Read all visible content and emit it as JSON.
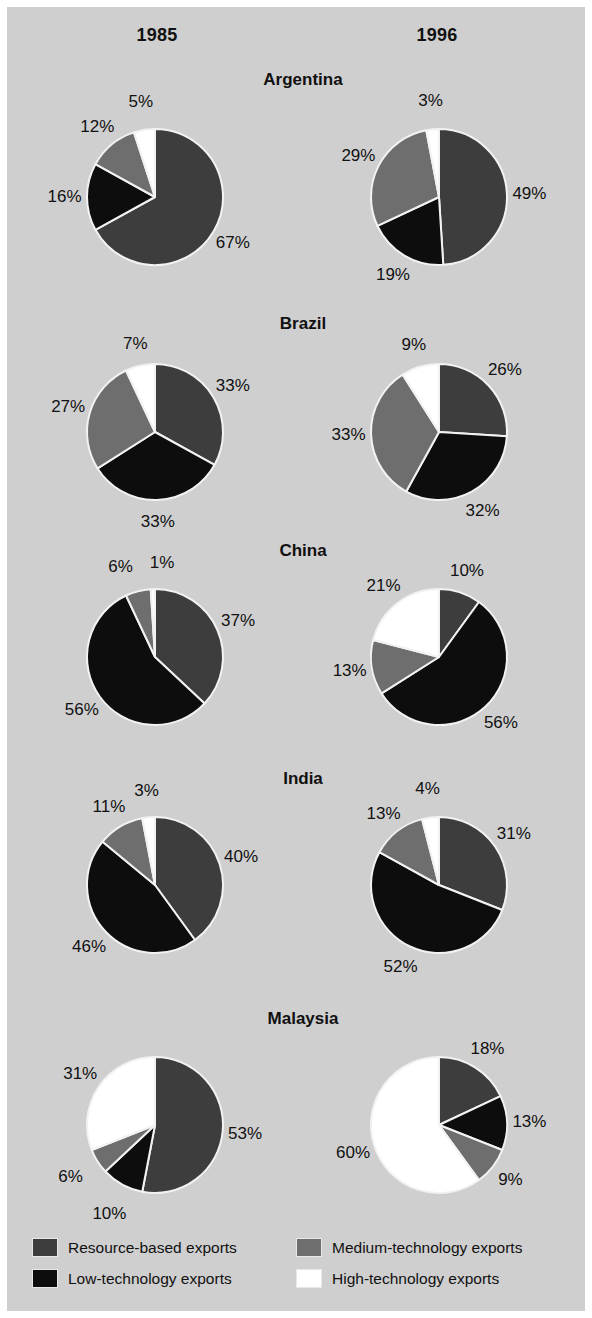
{
  "figure": {
    "background_color": "#cfcfcf",
    "border_color": "#ffffff",
    "text_color": "#111111"
  },
  "columns": [
    {
      "label": "1985",
      "key": "y1985"
    },
    {
      "label": "1996",
      "key": "y1996"
    }
  ],
  "legend": {
    "items": [
      {
        "label": "Resource-based exports",
        "color": "#3d3d3d",
        "key": "resource"
      },
      {
        "label": "Low-technology exports",
        "color": "#0d0d0d",
        "key": "low"
      },
      {
        "label": "Medium-technology exports",
        "color": "#6e6e6e",
        "key": "medium"
      },
      {
        "label": "High-technology exports",
        "color": "#ffffff",
        "key": "high"
      }
    ]
  },
  "chart_data": {
    "type": "pie",
    "title": "",
    "subtitle": "",
    "xlabel": "",
    "ylabel": "",
    "legend_position": "bottom",
    "grid": false,
    "units": "percent",
    "slice_order": [
      "resource",
      "low",
      "medium",
      "high"
    ],
    "category_labels": [
      "Resource-based exports",
      "Low-technology exports",
      "Medium-technology exports",
      "High-technology exports"
    ],
    "category_colors": [
      "#3d3d3d",
      "#0d0d0d",
      "#6e6e6e",
      "#ffffff"
    ],
    "years": [
      "1985",
      "1996"
    ],
    "countries": [
      {
        "name": "Argentina",
        "pies": [
          {
            "year": "1985",
            "values": [
              67,
              16,
              12,
              5
            ],
            "labels": [
              "67%",
              "16%",
              "12%",
              "5%"
            ]
          },
          {
            "year": "1996",
            "values": [
              49,
              19,
              29,
              3
            ],
            "labels": [
              "49%",
              "19%",
              "29%",
              "3%"
            ]
          }
        ]
      },
      {
        "name": "Brazil",
        "pies": [
          {
            "year": "1985",
            "values": [
              33,
              33,
              27,
              7
            ],
            "labels": [
              "33%",
              "33%",
              "27%",
              "7%"
            ]
          },
          {
            "year": "1996",
            "values": [
              26,
              32,
              33,
              9
            ],
            "labels": [
              "26%",
              "32%",
              "33%",
              "9%"
            ]
          }
        ]
      },
      {
        "name": "China",
        "pies": [
          {
            "year": "1985",
            "values": [
              37,
              56,
              6,
              1
            ],
            "labels": [
              "37%",
              "56%",
              "6%",
              "1%"
            ]
          },
          {
            "year": "1996",
            "values": [
              10,
              56,
              13,
              21
            ],
            "labels": [
              "10%",
              "56%",
              "13%",
              "21%"
            ]
          }
        ]
      },
      {
        "name": "India",
        "pies": [
          {
            "year": "1985",
            "values": [
              40,
              46,
              11,
              3
            ],
            "labels": [
              "40%",
              "46%",
              "11%",
              "3%"
            ]
          },
          {
            "year": "1996",
            "values": [
              31,
              52,
              13,
              4
            ],
            "labels": [
              "31%",
              "52%",
              "13%",
              "4%"
            ]
          }
        ]
      },
      {
        "name": "Malaysia",
        "pies": [
          {
            "year": "1985",
            "values": [
              53,
              10,
              6,
              31
            ],
            "labels": [
              "53%",
              "10%",
              "6%",
              "31%"
            ]
          },
          {
            "year": "1996",
            "values": [
              18,
              13,
              9,
              60
            ],
            "labels": [
              "18%",
              "13%",
              "9%",
              "60%"
            ]
          }
        ]
      }
    ]
  },
  "layout": {
    "year_header_y": 18,
    "year_header_x": [
      90,
      370
    ],
    "rows": [
      {
        "title_y": 63,
        "pie_cy": 190
      },
      {
        "title_y": 307,
        "pie_cy": 425
      },
      {
        "title_y": 534,
        "pie_cy": 650
      },
      {
        "title_y": 762,
        "pie_cy": 878
      },
      {
        "title_y": 1002,
        "pie_cy": 1118
      }
    ],
    "pie_cx": [
      148,
      432
    ],
    "pie_radius": 68,
    "label_radius_factor": 1.33
  }
}
